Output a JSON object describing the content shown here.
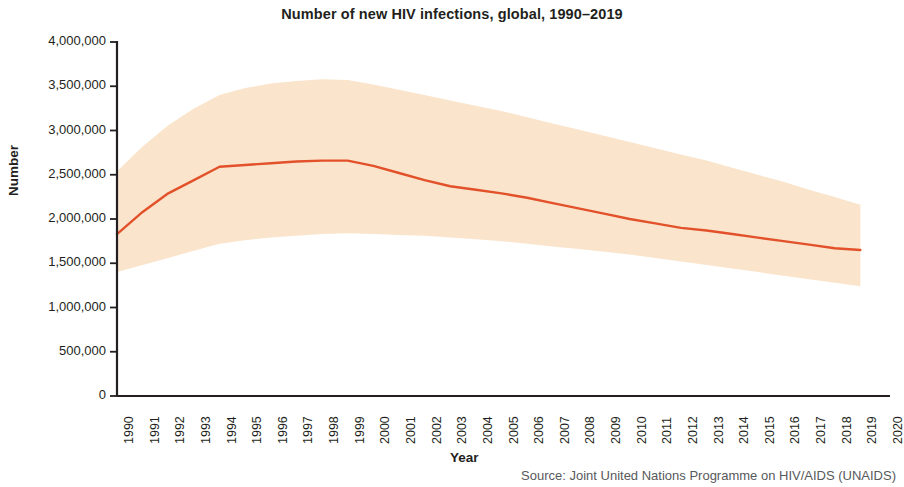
{
  "chart_data": {
    "type": "line",
    "title": "Number of new HIV infections, global, 1990–2019",
    "xlabel": "Year",
    "ylabel": "Number",
    "source": "Source: Joint United Nations Programme on HIV/AIDS (UNAIDS)",
    "grid": false,
    "legend": "none",
    "xlim": [
      1990,
      2020
    ],
    "ylim": [
      0,
      4000000
    ],
    "xticks": [
      1990,
      1991,
      1992,
      1993,
      1994,
      1995,
      1996,
      1997,
      1998,
      1999,
      2000,
      2001,
      2002,
      2003,
      2004,
      2005,
      2006,
      2007,
      2008,
      2009,
      2010,
      2011,
      2012,
      2013,
      2014,
      2015,
      2016,
      2017,
      2018,
      2019,
      2020
    ],
    "xtick_labels": [
      "1990",
      "1991",
      "1992",
      "1993",
      "1994",
      "1995",
      "1996",
      "1997",
      "1998",
      "1999",
      "2000",
      "2001",
      "2002",
      "2003",
      "2004",
      "2005",
      "2006",
      "2007",
      "2008",
      "2009",
      "2010",
      "2011",
      "2012",
      "2013",
      "2014",
      "2015",
      "2016",
      "2017",
      "2018",
      "2019",
      "2020"
    ],
    "yticks": [
      0,
      500000,
      1000000,
      1500000,
      2000000,
      2500000,
      3000000,
      3500000,
      4000000
    ],
    "ytick_labels": [
      "0",
      "500,000",
      "1,000,000",
      "1,500,000",
      "2,000,000",
      "2,500,000",
      "3,000,000",
      "3,500,000",
      "4,000,000"
    ],
    "x": [
      1990,
      1991,
      1992,
      1993,
      1994,
      1995,
      1996,
      1997,
      1998,
      1999,
      2000,
      2001,
      2002,
      2003,
      2004,
      2005,
      2006,
      2007,
      2008,
      2009,
      2010,
      2011,
      2012,
      2013,
      2014,
      2015,
      2016,
      2017,
      2018,
      2019
    ],
    "series": [
      {
        "name": "New HIV infections (estimate)",
        "color": "#e2512a",
        "values": [
          1830000,
          2080000,
          2290000,
          2440000,
          2590000,
          2610000,
          2630000,
          2650000,
          2660000,
          2660000,
          2600000,
          2520000,
          2440000,
          2370000,
          2330000,
          2290000,
          2240000,
          2180000,
          2120000,
          2060000,
          2000000,
          1950000,
          1900000,
          1870000,
          1830000,
          1790000,
          1750000,
          1710000,
          1670000,
          1650000
        ]
      }
    ],
    "uncertainty_band": {
      "name": "Uncertainty range",
      "color": "#fae5cc",
      "upper": [
        2540000,
        2820000,
        3060000,
        3250000,
        3400000,
        3480000,
        3530000,
        3560000,
        3580000,
        3570000,
        3520000,
        3460000,
        3400000,
        3340000,
        3280000,
        3220000,
        3150000,
        3080000,
        3010000,
        2940000,
        2870000,
        2800000,
        2730000,
        2660000,
        2580000,
        2500000,
        2420000,
        2330000,
        2250000,
        2160000
      ],
      "lower": [
        1400000,
        1480000,
        1560000,
        1640000,
        1720000,
        1760000,
        1790000,
        1810000,
        1830000,
        1840000,
        1830000,
        1820000,
        1810000,
        1790000,
        1770000,
        1750000,
        1720000,
        1690000,
        1660000,
        1630000,
        1600000,
        1560000,
        1520000,
        1480000,
        1440000,
        1400000,
        1360000,
        1320000,
        1280000,
        1240000
      ]
    }
  }
}
